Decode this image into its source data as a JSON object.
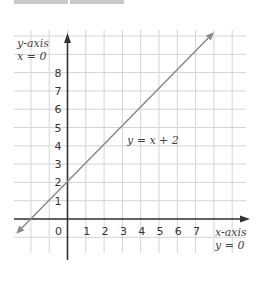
{
  "header_tabs": [
    {
      "label": ""
    },
    {
      "label": ""
    }
  ],
  "chart_data": {
    "type": "line",
    "title": "",
    "equation_label": "y = x + 2",
    "series": [
      {
        "name": "y = x + 2",
        "x": [
          -2.8,
          8
        ],
        "y": [
          -0.8,
          10.2
        ],
        "color": "#8a8a8a"
      }
    ],
    "xlabel": "x-axis",
    "xlabel_sub": "y = 0",
    "ylabel": "y-axis",
    "ylabel_sub": "x = 0",
    "x_ticks": [
      "0",
      "1",
      "2",
      "3",
      "4",
      "5",
      "6",
      "7"
    ],
    "y_ticks": [
      "1",
      "2",
      "3",
      "4",
      "5",
      "6",
      "7",
      "8"
    ],
    "xlim": [
      -3,
      9.5
    ],
    "ylim": [
      -1.8,
      10.3
    ],
    "grid": true,
    "grid_color": "#d4d4d4",
    "axis_color": "#333333"
  }
}
